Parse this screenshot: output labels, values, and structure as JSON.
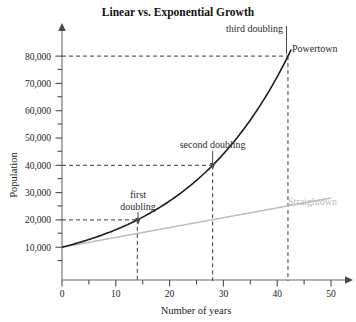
{
  "chart_data": {
    "type": "line",
    "title": "Linear vs. Exponential Growth",
    "xlabel": "Number of years",
    "ylabel": "Population",
    "xlim": [
      0,
      50
    ],
    "ylim": [
      0,
      85000
    ],
    "grid": false,
    "legend_position": "inline-labels",
    "x_ticks": [
      0,
      10,
      20,
      30,
      40,
      50
    ],
    "x_tick_labels": [
      "0",
      "10",
      "20",
      "30",
      "40",
      "50"
    ],
    "x_minor_step": 5,
    "y_ticks": [
      10000,
      20000,
      30000,
      40000,
      50000,
      60000,
      70000,
      80000
    ],
    "y_tick_labels": [
      "10,000",
      "20,000",
      "30,000",
      "40,000",
      "50,000",
      "60,000",
      "70,000",
      "80,000"
    ],
    "y_minor_step": 5000,
    "series": [
      {
        "name": "Powertown",
        "kind": "exponential",
        "color": "#1c1c1c",
        "start_value": 10000,
        "doubling_time_years": 14,
        "x": [
          0,
          14,
          28,
          42
        ],
        "values": [
          10000,
          20000,
          40000,
          80000
        ]
      },
      {
        "name": "Straightown",
        "kind": "linear",
        "color": "#bdbdbd",
        "start_value": 10000,
        "x": [
          0,
          50
        ],
        "values": [
          10000,
          28000
        ]
      }
    ],
    "annotations": [
      {
        "id": "first-doubling",
        "text": "first doubling",
        "lines": [
          "first",
          "doubling"
        ],
        "x": 14,
        "y": 20000
      },
      {
        "id": "second-doubling",
        "text": "second doubling",
        "lines": [
          "second doubling"
        ],
        "x": 28,
        "y": 40000
      },
      {
        "id": "third-doubling",
        "text": "third doubling",
        "lines": [
          "third doubling"
        ],
        "x": 42,
        "y": 80000
      }
    ],
    "guide_lines": [
      {
        "y": 20000,
        "x_to": 14
      },
      {
        "y": 40000,
        "x_to": 28
      },
      {
        "y": 80000,
        "x_to": 42
      }
    ]
  },
  "labels": {
    "title": "Linear vs. Exponential Growth",
    "x_axis": "Number of years",
    "y_axis": "Population",
    "powertown": "Powertown",
    "straightown": "Straightown",
    "first_doubling_line1": "first",
    "first_doubling_line2": "doubling",
    "second_doubling": "second doubling",
    "third_doubling": "third doubling",
    "y_80000": "80,000",
    "y_70000": "70,000",
    "y_60000": "60,000",
    "y_50000": "50,000",
    "y_40000": "40,000",
    "y_30000": "30,000",
    "y_20000": "20,000",
    "y_10000": "10,000",
    "x_0": "0",
    "x_10": "10",
    "x_20": "20",
    "x_30": "30",
    "x_40": "40",
    "x_50": "50"
  }
}
